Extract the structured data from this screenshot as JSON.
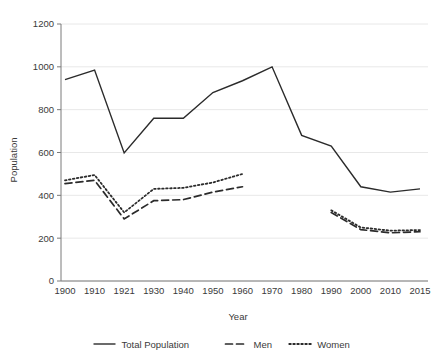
{
  "chart_data": {
    "type": "line",
    "title": "",
    "xlabel": "Year",
    "ylabel": "Population",
    "categories": [
      "1900",
      "1910",
      "1921",
      "1930",
      "1940",
      "1950",
      "1960",
      "1970",
      "1980",
      "1990",
      "2000",
      "2010",
      "2015"
    ],
    "ylim": [
      0,
      1200
    ],
    "yticks": [
      0,
      200,
      400,
      600,
      800,
      1000,
      1200
    ],
    "grid": true,
    "legend_position": "bottom",
    "series": [
      {
        "name": "Total Population",
        "style": "solid",
        "color": "#2b2b2b",
        "values": [
          940,
          985,
          598,
          760,
          760,
          880,
          935,
          1000,
          680,
          630,
          440,
          415,
          430
        ]
      },
      {
        "name": "Men",
        "style": "dashed",
        "color": "#2b2b2b",
        "values": [
          455,
          470,
          290,
          375,
          380,
          415,
          440,
          null,
          null,
          320,
          240,
          225,
          230
        ]
      },
      {
        "name": "Women",
        "style": "dotted",
        "color": "#2b2b2b",
        "values": [
          470,
          495,
          320,
          430,
          435,
          460,
          500,
          null,
          null,
          330,
          250,
          235,
          238
        ]
      }
    ]
  },
  "legend": {
    "items": [
      {
        "label": "Total Population"
      },
      {
        "label": "Men"
      },
      {
        "label": "Women"
      }
    ]
  },
  "axes": {
    "y_title": "Population",
    "x_title": "Year"
  }
}
